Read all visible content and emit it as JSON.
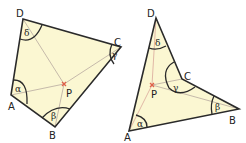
{
  "figures": [
    {
      "name": "convex-quadrilateral",
      "vertices": {
        "A": "A",
        "B": "B",
        "C": "C",
        "D": "D"
      },
      "point": "P",
      "angles": {
        "A": "α",
        "B": "β",
        "C": "γ",
        "D": "δ"
      }
    },
    {
      "name": "concave-quadrilateral",
      "vertices": {
        "A": "A",
        "B": "B",
        "C": "C",
        "D": "D"
      },
      "point": "P",
      "angles": {
        "A": "α",
        "B": "β",
        "C": "γ",
        "D": "δ"
      }
    }
  ],
  "colors": {
    "fill": "#fbf7d2",
    "outline": "#2a2a2a",
    "inner_line": "#b8a9a0",
    "point_marker": "#e0614a",
    "arc": "#2a2a2a"
  }
}
